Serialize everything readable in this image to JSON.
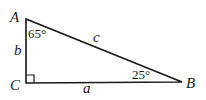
{
  "diagram": {
    "type": "right-triangle",
    "vertices": {
      "A": {
        "label": "A",
        "angle": "65°"
      },
      "B": {
        "label": "B",
        "angle": "25°"
      },
      "C": {
        "label": "C",
        "angle": "90°",
        "right_angle_marker": true
      }
    },
    "sides": {
      "a": {
        "label": "a",
        "between": "C-B"
      },
      "b": {
        "label": "b",
        "between": "A-C"
      },
      "c": {
        "label": "c",
        "between": "A-B"
      }
    },
    "colors": {
      "stroke": "#1a1a1a",
      "background": "#ffffff"
    }
  }
}
